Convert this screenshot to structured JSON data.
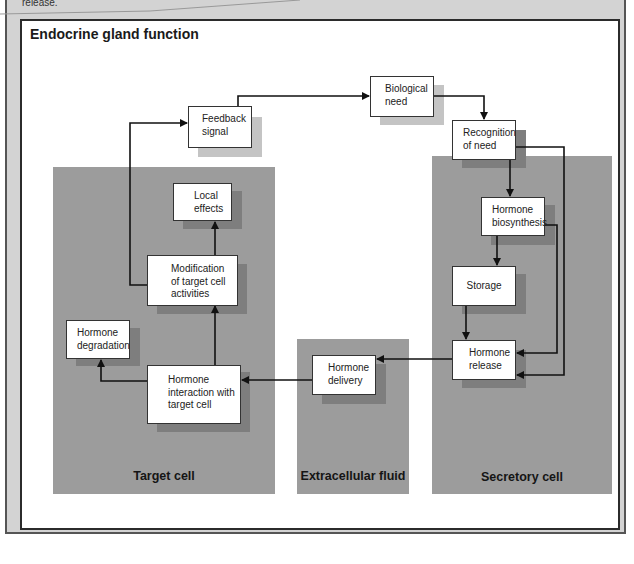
{
  "caption_fragment": "release.",
  "diagram": {
    "title": "Endocrine gland function",
    "regions": [
      {
        "id": "target-cell",
        "label": "Target cell"
      },
      {
        "id": "extracellular-fluid",
        "label": "Extracellular fluid"
      },
      {
        "id": "secretory-cell",
        "label": "Secretory cell"
      }
    ],
    "nodes": {
      "feedback_signal": {
        "line1": "Feedback",
        "line2": "signal"
      },
      "biological_need": {
        "line1": "Biological",
        "line2": "need"
      },
      "recognition_of_need": {
        "line1": "Recognition",
        "line2": "of need"
      },
      "hormone_biosynthesis": {
        "line1": "Hormone",
        "line2": "biosynthesis"
      },
      "storage": {
        "line1": "Storage"
      },
      "hormone_release": {
        "line1": "Hormone",
        "line2": "release"
      },
      "hormone_delivery": {
        "line1": "Hormone",
        "line2": "delivery"
      },
      "hormone_interaction": {
        "line1": "Hormone",
        "line2": "interaction with",
        "line3": "target cell"
      },
      "hormone_degradation": {
        "line1": "Hormone",
        "line2": "degradation"
      },
      "modification": {
        "line1": "Modification",
        "line2": "of target cell",
        "line3": "activities"
      },
      "local_effects": {
        "line1": "Local",
        "line2": "effects"
      }
    },
    "edges": [
      {
        "from": "Feedback signal",
        "to": "Biological need"
      },
      {
        "from": "Biological need",
        "to": "Recognition of need"
      },
      {
        "from": "Recognition of need",
        "to": "Hormone biosynthesis"
      },
      {
        "from": "Recognition of need",
        "to": "Hormone release"
      },
      {
        "from": "Hormone biosynthesis",
        "to": "Storage"
      },
      {
        "from": "Hormone biosynthesis",
        "to": "Hormone release"
      },
      {
        "from": "Storage",
        "to": "Hormone release"
      },
      {
        "from": "Hormone release",
        "to": "Hormone delivery"
      },
      {
        "from": "Hormone delivery",
        "to": "Hormone interaction with target cell"
      },
      {
        "from": "Hormone interaction with target cell",
        "to": "Hormone degradation"
      },
      {
        "from": "Hormone interaction with target cell",
        "to": "Modification of target cell activities"
      },
      {
        "from": "Modification of target cell activities",
        "to": "Local effects"
      },
      {
        "from": "Modification of target cell activities",
        "to": "Feedback signal"
      }
    ]
  }
}
